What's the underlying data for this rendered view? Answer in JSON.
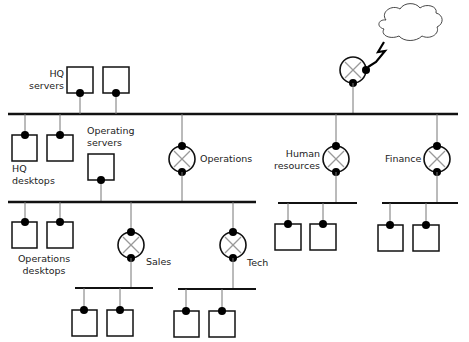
{
  "diagram": {
    "type": "network-topology",
    "colors": {
      "line": "#111111",
      "thin_line": "#777777",
      "node_fill": "#ffffff",
      "dot": "#000000",
      "background": "#ffffff"
    },
    "labels": {
      "hq_servers": "HQ\nservers",
      "hq_desktops": "HQ\ndesktops",
      "operating_servers": "Operating\nservers",
      "operations": "Operations",
      "human_resources": "Human\nresources",
      "finance": "Finance",
      "operations_desktops": "Operations\ndesktops",
      "sales": "Sales",
      "tech": "Tech"
    },
    "nodes": [
      {
        "id": "internet-cloud",
        "kind": "cloud"
      },
      {
        "id": "internet-router",
        "kind": "router"
      },
      {
        "id": "hq-server-1",
        "kind": "computer"
      },
      {
        "id": "hq-server-2",
        "kind": "computer"
      },
      {
        "id": "hq-desktop-1",
        "kind": "computer"
      },
      {
        "id": "hq-desktop-2",
        "kind": "computer"
      },
      {
        "id": "operating-server",
        "kind": "computer"
      },
      {
        "id": "operations-router",
        "kind": "router"
      },
      {
        "id": "hr-router",
        "kind": "router"
      },
      {
        "id": "finance-router",
        "kind": "router"
      },
      {
        "id": "ops-desktop-1",
        "kind": "computer"
      },
      {
        "id": "ops-desktop-2",
        "kind": "computer"
      },
      {
        "id": "sales-router",
        "kind": "router"
      },
      {
        "id": "tech-router",
        "kind": "router"
      },
      {
        "id": "sales-pc-1",
        "kind": "computer"
      },
      {
        "id": "sales-pc-2",
        "kind": "computer"
      },
      {
        "id": "tech-pc-1",
        "kind": "computer"
      },
      {
        "id": "tech-pc-2",
        "kind": "computer"
      },
      {
        "id": "hr-pc-1",
        "kind": "computer"
      },
      {
        "id": "hr-pc-2",
        "kind": "computer"
      },
      {
        "id": "finance-pc-1",
        "kind": "computer"
      },
      {
        "id": "finance-pc-2",
        "kind": "computer"
      }
    ],
    "buses": [
      "hq-backbone",
      "operations-lan",
      "sales-lan",
      "tech-lan",
      "hr-lan",
      "finance-lan"
    ]
  }
}
